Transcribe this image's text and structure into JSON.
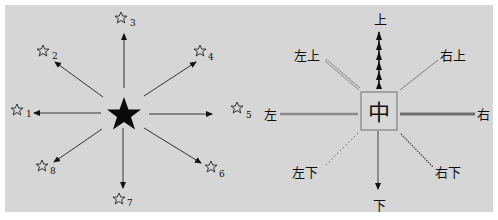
{
  "colors": {
    "background": "#d6d6d6",
    "ink": "#111111",
    "gray_line": "#7a7a7a",
    "center_box_border": "#808080"
  },
  "left_diagram": {
    "center": {
      "icon": "filled-star",
      "x": 124,
      "y": 115
    },
    "targets": [
      {
        "number": "1",
        "icon": "outline-star",
        "x": 18,
        "y": 110,
        "arrow_to": [
          34,
          113
        ]
      },
      {
        "number": "2",
        "icon": "outline-star",
        "x": 43,
        "y": 50,
        "arrow_to": [
          54,
          62
        ]
      },
      {
        "number": "3",
        "icon": "outline-star",
        "x": 120,
        "y": 16,
        "arrow_to": [
          124,
          34
        ]
      },
      {
        "number": "4",
        "icon": "outline-star",
        "x": 200,
        "y": 50,
        "arrow_to": [
          196,
          62
        ]
      },
      {
        "number": "5",
        "icon": "outline-star",
        "x": 237,
        "y": 108,
        "arrow_to": [
          212,
          114
        ]
      },
      {
        "number": "6",
        "icon": "outline-star",
        "x": 211,
        "y": 167,
        "arrow_to": [
          200,
          163
        ]
      },
      {
        "number": "7",
        "icon": "outline-star",
        "x": 118,
        "y": 198,
        "arrow_to": [
          123,
          188
        ]
      },
      {
        "number": "8",
        "icon": "outline-star",
        "x": 42,
        "y": 165,
        "arrow_to": [
          53,
          162
        ]
      }
    ]
  },
  "right_diagram": {
    "center": {
      "label": "中",
      "x": 382,
      "y": 114
    },
    "labels": {
      "up": "上",
      "down": "下",
      "left": "左",
      "right": "右",
      "up_left": "左上",
      "up_right": "右上",
      "down_left": "左下",
      "down_right": "右下"
    },
    "line_styles": {
      "up": "dashed-arrow-chain",
      "down": "solid-arrow",
      "left": "thick-gray",
      "right": "thick-dark-gray",
      "up_left": "double-thin",
      "up_right": "thin-solid",
      "down_left": "dotted",
      "down_right": "dense-dotted"
    }
  }
}
